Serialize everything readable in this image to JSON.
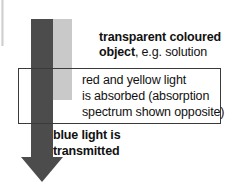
{
  "diagram": {
    "arrow": {
      "name": "light-beam-arrow",
      "direction": "down",
      "color": "#4c4c4c"
    },
    "object_band": {
      "name": "transparent-coloured-object-band",
      "color": "#c9c9c9"
    },
    "labels": {
      "object": {
        "bold_line1": "transparent coloured",
        "bold_line2": "object",
        "regular_suffix": ", e.g. solution"
      },
      "absorption_box": {
        "line1": "red and yellow light",
        "line2": "is absorbed (absorption",
        "line3": "spectrum shown opposite)",
        "border_color": "#3a3a3a"
      },
      "transmitted": {
        "line1": "blue light is",
        "line2": "transmitted"
      }
    }
  }
}
